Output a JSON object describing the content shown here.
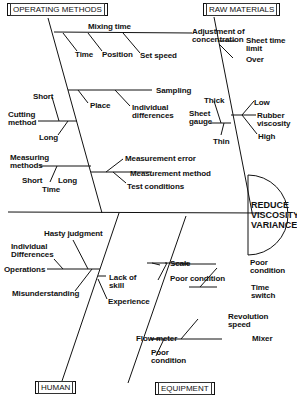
{
  "effect": {
    "line1": "REDUCE",
    "line2": "VISCOSITY",
    "line3": "VARIANCE"
  },
  "categories": {
    "operating_methods": "OPERATING METHODS",
    "raw_materials": "RAW MATERIALS",
    "human": "HUMAN",
    "equipment": "EQUIPMENT"
  },
  "operating_methods": {
    "mixing_time": "Mixing time",
    "adjustment": [
      "Adjustment of",
      "concentration"
    ],
    "time": "Time",
    "position": "Position",
    "set_speed": "Set speed",
    "sampling": "Sampling",
    "place": "Place",
    "individual_differences": [
      "Individual",
      "differences"
    ],
    "short": "Short",
    "cutting_method": [
      "Cutting",
      "method"
    ],
    "long": "Long",
    "measuring_methods": [
      "Measuring",
      "methods"
    ],
    "mm_short": "Short",
    "mm_long": "Long",
    "mm_time": "Time",
    "measurement_error": "Measurement error",
    "measurement_method": "Measurement method",
    "test_conditions": "Test conditions"
  },
  "raw_materials": {
    "sheet_time_limit": [
      "Sheet time",
      "limit"
    ],
    "over": "Over",
    "thick": "Thick",
    "sheet_gauge": [
      "Sheet",
      "gauge"
    ],
    "thin": "Thin",
    "low": "Low",
    "rubber_viscosity": [
      "Rubber",
      "viscosity"
    ],
    "high": "High"
  },
  "human": {
    "hasty_judgment": "Hasty judgment",
    "individual_differences": [
      "Individual",
      "Differences"
    ],
    "operations": "Operations",
    "misunderstanding": "Misunderstanding",
    "lack_of_skill": [
      "Lack of",
      "skill"
    ],
    "experience": "Experience"
  },
  "equipment": {
    "scale": "Scale",
    "poor_condition_1": "Poor condition",
    "poor_condition_2": [
      "Poor",
      "condition"
    ],
    "time_switch": [
      "Time",
      "switch"
    ],
    "revolution_speed": [
      "Revolution",
      "speed"
    ],
    "flow_meter": "Flow meter",
    "mixer": "Mixer",
    "poor_condition_3": [
      "Poor",
      "condition"
    ]
  }
}
